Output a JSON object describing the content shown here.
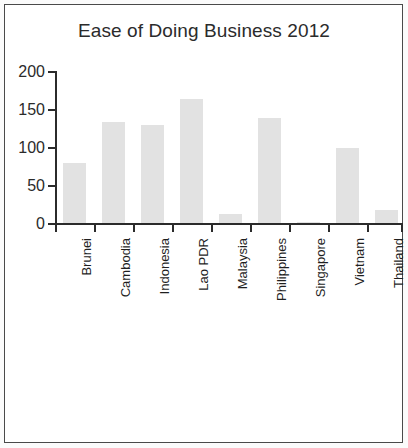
{
  "chart_data": {
    "type": "bar",
    "title": "Ease of Doing Business 2012",
    "xlabel": "",
    "ylabel": "",
    "categories": [
      "Brunei",
      "Cambodia",
      "Indonesia",
      "Lao PDR",
      "Malaysia",
      "Philippines",
      "Singapore",
      "Vietnam",
      "Thailand"
    ],
    "values": [
      79,
      133,
      129,
      163,
      12,
      138,
      1,
      99,
      17
    ],
    "ylim": [
      0,
      200
    ],
    "yticks": [
      0,
      50,
      100,
      150,
      200
    ],
    "ytick_labels": [
      "0",
      "50",
      "100",
      "150",
      "200"
    ],
    "grid": false,
    "legend": false,
    "bar_color": "#e2e2e2",
    "axis_color": "#2b2b2b",
    "background_color": "#ffffff"
  },
  "figure": {
    "border_color": "#4a4a4a",
    "page_background": "#fbfbfb"
  }
}
